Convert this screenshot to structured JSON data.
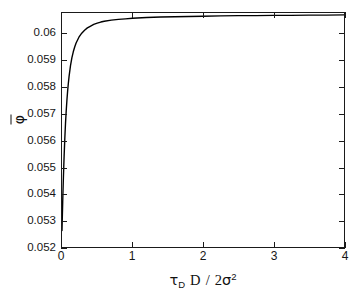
{
  "chart_data": {
    "type": "line",
    "title": "",
    "subtitle": "",
    "xlabel": "τ_D D / 2σ²",
    "xlabel_parts": {
      "tau": "τ",
      "tau_sub": "D",
      "numerator_var": "D",
      "slash": "/",
      "two": "2",
      "sigma": "σ",
      "sigma_exp": "2"
    },
    "ylabel": "φ̄",
    "ylabel_glyph": "φ",
    "xlim": [
      0,
      4
    ],
    "ylim": [
      0.052,
      0.0608
    ],
    "xticks": [
      0,
      1,
      2,
      3,
      4
    ],
    "xticklabels": [
      "0",
      "1",
      "2",
      "3",
      "4"
    ],
    "yticks": [
      0.052,
      0.053,
      0.054,
      0.055,
      0.056,
      0.057,
      0.058,
      0.059,
      0.06
    ],
    "yticklabels": [
      "0.052",
      "0.053",
      "0.054",
      "0.055",
      "0.056",
      "0.057",
      "0.058",
      "0.059",
      "0.06"
    ],
    "grid": false,
    "legend": null,
    "legend_position": "none",
    "series": [
      {
        "name": "phi-bar",
        "color": "#000000",
        "linewidth": 1.4,
        "x": [
          0.0,
          0.005,
          0.01,
          0.015,
          0.02,
          0.025,
          0.03,
          0.04,
          0.05,
          0.06,
          0.07,
          0.08,
          0.09,
          0.1,
          0.12,
          0.14,
          0.16,
          0.18,
          0.2,
          0.24,
          0.28,
          0.32,
          0.36,
          0.4,
          0.45,
          0.5,
          0.55,
          0.6,
          0.7,
          0.8,
          0.9,
          1.0,
          1.2,
          1.4,
          1.6,
          1.8,
          2.0,
          2.25,
          2.5,
          2.75,
          3.0,
          3.25,
          3.5,
          3.75,
          4.0
        ],
        "y": [
          0.05262,
          0.05317,
          0.05369,
          0.05417,
          0.05462,
          0.05503,
          0.05541,
          0.05609,
          0.05666,
          0.05713,
          0.05753,
          0.05787,
          0.05816,
          0.05841,
          0.05881,
          0.05911,
          0.05934,
          0.05952,
          0.05967,
          0.05989,
          0.06004,
          0.06015,
          0.06024,
          0.0603,
          0.06037,
          0.06042,
          0.06046,
          0.06049,
          0.06053,
          0.06056,
          0.06058,
          0.0606,
          0.06063,
          0.06065,
          0.06066,
          0.06067,
          0.06068,
          0.06069,
          0.0607,
          0.0607,
          0.06071,
          0.06071,
          0.06072,
          0.06072,
          0.06073
        ]
      }
    ],
    "axis_color": "#1a1a1a",
    "background_color": "#ffffff",
    "tick_direction": "in",
    "annotations": []
  }
}
